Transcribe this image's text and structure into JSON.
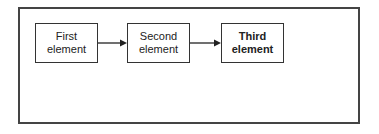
{
  "diagram": {
    "nodes": [
      {
        "id": "first",
        "lines": [
          "First",
          "element"
        ],
        "bold": false
      },
      {
        "id": "second",
        "lines": [
          "Second",
          "element"
        ],
        "bold": false
      },
      {
        "id": "third",
        "lines": [
          "Third",
          "element"
        ],
        "bold": true
      }
    ],
    "edges": [
      {
        "from": "first",
        "to": "second"
      },
      {
        "from": "second",
        "to": "third"
      }
    ],
    "colors": {
      "stroke": "#333333",
      "frame": "#444444",
      "background": "#ffffff"
    }
  }
}
